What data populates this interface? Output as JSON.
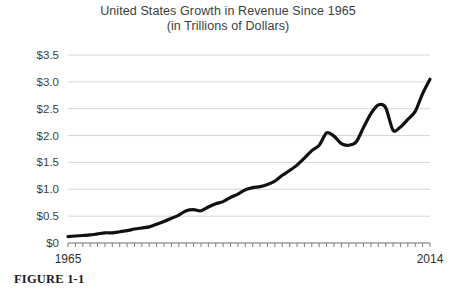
{
  "figure": {
    "caption": "FIGURE 1-1"
  },
  "chart_data": {
    "type": "line",
    "title": "United States Growth in Revenue Since 1965",
    "subtitle": "(in Trillions of Dollars)",
    "xlabel": "",
    "ylabel": "",
    "xlim": [
      1965,
      2014
    ],
    "ylim": [
      0,
      3.5
    ],
    "grid": true,
    "legend": false,
    "y_ticks": [
      0,
      0.5,
      1.0,
      1.5,
      2.0,
      2.5,
      3.0,
      3.5
    ],
    "y_tick_labels": [
      "$0",
      "$0.5",
      "$1.0",
      "$1.5",
      "$2.0",
      "$2.5",
      "$3.0",
      "$3.5"
    ],
    "x_ticks": [
      1965,
      2014
    ],
    "x_tick_labels": [
      "1965",
      "2014"
    ],
    "x_minor_tick_interval": 1,
    "series_name": "United States Revenue",
    "line_color": "#111111",
    "line_width_px": 3.2,
    "x": [
      1965,
      1966,
      1967,
      1968,
      1969,
      1970,
      1971,
      1972,
      1973,
      1974,
      1975,
      1976,
      1977,
      1978,
      1979,
      1980,
      1981,
      1982,
      1983,
      1984,
      1985,
      1986,
      1987,
      1988,
      1989,
      1990,
      1991,
      1992,
      1993,
      1994,
      1995,
      1996,
      1997,
      1998,
      1999,
      2000,
      2001,
      2002,
      2003,
      2004,
      2005,
      2006,
      2007,
      2008,
      2009,
      2010,
      2011,
      2012,
      2013,
      2014
    ],
    "values": [
      0.12,
      0.13,
      0.14,
      0.15,
      0.17,
      0.19,
      0.19,
      0.21,
      0.23,
      0.26,
      0.28,
      0.3,
      0.35,
      0.4,
      0.46,
      0.52,
      0.6,
      0.62,
      0.6,
      0.67,
      0.73,
      0.77,
      0.85,
      0.91,
      0.99,
      1.03,
      1.05,
      1.09,
      1.15,
      1.26,
      1.35,
      1.45,
      1.58,
      1.72,
      1.82,
      2.05,
      1.99,
      1.85,
      1.82,
      1.88,
      2.15,
      2.41,
      2.57,
      2.52,
      2.1,
      2.16,
      2.3,
      2.45,
      2.78,
      3.05
    ],
    "annotations": []
  }
}
